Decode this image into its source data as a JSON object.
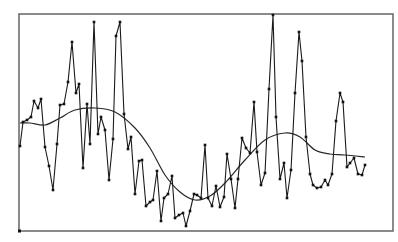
{
  "chart_data": {
    "type": "line",
    "title": "",
    "xlabel": "",
    "ylabel": "",
    "grid": false,
    "legend": null,
    "axes_ticks": "none",
    "frame": {
      "left": 19,
      "top": 14,
      "right": 393,
      "bottom": 231
    },
    "xlim": [
      0,
      100
    ],
    "ylim": [
      0,
      100
    ],
    "series": [
      {
        "name": "observed",
        "style": "line-with-markers",
        "color": "#1a1a1a",
        "points_px": [
          [
            20,
            146
          ],
          [
            23,
            122
          ],
          [
            27,
            120
          ],
          [
            31,
            117
          ],
          [
            34,
            101
          ],
          [
            38,
            108
          ],
          [
            41,
            99
          ],
          [
            45,
            147
          ],
          [
            49,
            166
          ],
          [
            53,
            190
          ],
          [
            57,
            144
          ],
          [
            60,
            105
          ],
          [
            64,
            104
          ],
          [
            68,
            82
          ],
          [
            72,
            42
          ],
          [
            76,
            93
          ],
          [
            79,
            84
          ],
          [
            83,
            168
          ],
          [
            87,
            104
          ],
          [
            90,
            144
          ],
          [
            94,
            22
          ],
          [
            98,
            134
          ],
          [
            101,
            117
          ],
          [
            105,
            130
          ],
          [
            109,
            180
          ],
          [
            113,
            139
          ],
          [
            116,
            36
          ],
          [
            120,
            22
          ],
          [
            124,
            114
          ],
          [
            128,
            149
          ],
          [
            131,
            137
          ],
          [
            135,
            194
          ],
          [
            139,
            161
          ],
          [
            142,
            160
          ],
          [
            146,
            206
          ],
          [
            150,
            202
          ],
          [
            153,
            200
          ],
          [
            157,
            171
          ],
          [
            161,
            221
          ],
          [
            164,
            198
          ],
          [
            168,
            194
          ],
          [
            172,
            176
          ],
          [
            175,
            218
          ],
          [
            179,
            215
          ],
          [
            183,
            213
          ],
          [
            186,
            226
          ],
          [
            190,
            211
          ],
          [
            194,
            194
          ],
          [
            197,
            195
          ],
          [
            201,
            198
          ],
          [
            205,
            145
          ],
          [
            208,
            198
          ],
          [
            212,
            206
          ],
          [
            216,
            186
          ],
          [
            220,
            207
          ],
          [
            224,
            197
          ],
          [
            227,
            154
          ],
          [
            231,
            179
          ],
          [
            235,
            208
          ],
          [
            238,
            179
          ],
          [
            242,
            138
          ],
          [
            246,
            148
          ],
          [
            250,
            153
          ],
          [
            254,
            102
          ],
          [
            257,
            152
          ],
          [
            261,
            185
          ],
          [
            265,
            173
          ],
          [
            269,
            89
          ],
          [
            273,
            15
          ],
          [
            276,
            117
          ],
          [
            280,
            179
          ],
          [
            284,
            163
          ],
          [
            287,
            198
          ],
          [
            291,
            170
          ],
          [
            295,
            93
          ],
          [
            299,
            32
          ],
          [
            302,
            61
          ],
          [
            306,
            137
          ],
          [
            310,
            174
          ],
          [
            313,
            185
          ],
          [
            317,
            188
          ],
          [
            321,
            187
          ],
          [
            325,
            180
          ],
          [
            328,
            185
          ],
          [
            332,
            174
          ],
          [
            336,
            121
          ],
          [
            340,
            93
          ],
          [
            343,
            102
          ],
          [
            347,
            167
          ],
          [
            350,
            163
          ],
          [
            354,
            158
          ],
          [
            358,
            174
          ],
          [
            362,
            175
          ],
          [
            365,
            165
          ]
        ]
      },
      {
        "name": "smoothed trend",
        "style": "smooth-line",
        "color": "#2a2a2a",
        "points_px": [
          [
            20,
            123
          ],
          [
            30,
            123
          ],
          [
            45,
            125
          ],
          [
            60,
            118
          ],
          [
            75,
            110
          ],
          [
            95,
            108
          ],
          [
            115,
            112
          ],
          [
            135,
            128
          ],
          [
            150,
            148
          ],
          [
            165,
            175
          ],
          [
            180,
            192
          ],
          [
            195,
            200
          ],
          [
            210,
            196
          ],
          [
            225,
            183
          ],
          [
            245,
            160
          ],
          [
            265,
            140
          ],
          [
            285,
            133
          ],
          [
            300,
            137
          ],
          [
            315,
            150
          ],
          [
            330,
            154
          ],
          [
            345,
            155
          ],
          [
            365,
            157
          ]
        ]
      }
    ]
  }
}
